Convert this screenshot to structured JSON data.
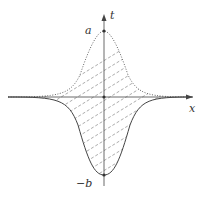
{
  "diagram": {
    "labels": {
      "t_axis": "t",
      "x_axis": "x",
      "peak_top": "a",
      "peak_bottom": "−b"
    },
    "curves": [
      {
        "name": "upper-gaussian",
        "style": "dotted",
        "peak_label": "a"
      },
      {
        "name": "lower-gaussian",
        "style": "solid",
        "peak_label": "−b"
      }
    ],
    "fill": {
      "style": "dashed-hatch",
      "direction": "diagonal"
    },
    "colors": {
      "line": "#555555",
      "hatch": "#888888",
      "axis": "#444444"
    }
  }
}
